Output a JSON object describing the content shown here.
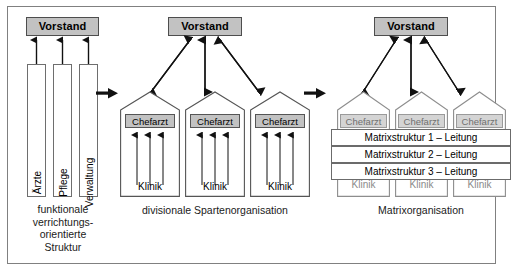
{
  "figure": {
    "colors": {
      "box_gray": "#c2c2c2",
      "box_gray_faded": "#d4d4d4",
      "outline": "#6e6e6e",
      "frame_border": "#808080",
      "background": "#ffffff",
      "text": "#000000",
      "text_faded": "#8a8a8a"
    }
  },
  "panels": [
    {
      "id": "functional",
      "top_box_label": "Vorstand",
      "columns": [
        {
          "label": "Ärzte"
        },
        {
          "label": "Pflege"
        },
        {
          "label": "Verwaltung"
        }
      ],
      "caption_lines": [
        "funktionale",
        "verrichtungs-",
        "orientierte",
        "Struktur"
      ],
      "caption": "funktionale verrichtungs- orientierte Struktur"
    },
    {
      "id": "divisional",
      "top_box_label": "Vorstand",
      "units": [
        {
          "head_label": "Chefarzt",
          "base_label": "Klinik"
        },
        {
          "head_label": "Chefarzt",
          "base_label": "Klinik"
        },
        {
          "head_label": "Chefarzt",
          "base_label": "Klinik"
        }
      ],
      "caption_lines": [
        "divisionale Spartenorganisation"
      ],
      "caption": "divisionale Spartenorganisation"
    },
    {
      "id": "matrix",
      "top_box_label": "Vorstand",
      "units": [
        {
          "head_label": "Chefarzt",
          "base_label": "Klinik"
        },
        {
          "head_label": "Chefarzt",
          "base_label": "Klinik"
        },
        {
          "head_label": "Chefarzt",
          "base_label": "Klinik"
        }
      ],
      "matrix_bars": [
        {
          "label": "Matrixstruktur 1 – Leitung"
        },
        {
          "label": "Matrixstruktur 2 – Leitung"
        },
        {
          "label": "Matrixstruktur 3 – Leitung"
        }
      ],
      "caption_lines": [
        "Matrixorganisation"
      ],
      "caption": "Matrixorganisation"
    }
  ],
  "separators": [
    {
      "id": "sep-1",
      "icon": "arrow-right-icon"
    },
    {
      "id": "sep-2",
      "icon": "arrow-right-icon"
    }
  ]
}
